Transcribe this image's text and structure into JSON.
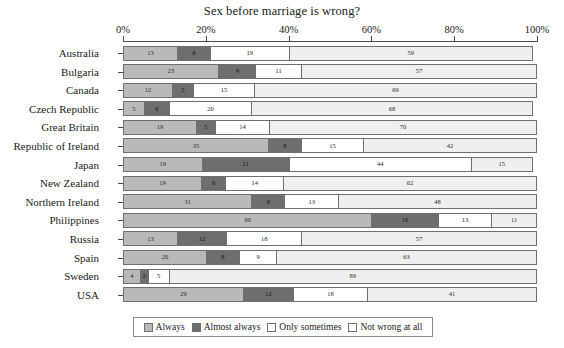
{
  "chart_data": {
    "type": "bar",
    "title": "Sex before marriage is wrong?",
    "xlabel": "",
    "ylabel": "",
    "xlim": [
      0,
      100
    ],
    "grid": false,
    "orientation": "horizontal",
    "stacked": true,
    "legend_position": "bottom",
    "tick_labels": [
      "0%",
      "20%",
      "40%",
      "60%",
      "80%",
      "100%"
    ],
    "tick_values": [
      0,
      20,
      40,
      60,
      80,
      100
    ],
    "categories": [
      "Australia",
      "Bulgaria",
      "Canada",
      "Czech Republic",
      "Great Britain",
      "Republic of Ireland",
      "Japan",
      "New Zealand",
      "Northern Ireland",
      "Philippines",
      "Russia",
      "Spain",
      "Sweden",
      "USA"
    ],
    "series": [
      {
        "name": "Always",
        "color": "#b9b9b9",
        "values": [
          13,
          23,
          12,
          5,
          19,
          35,
          19,
          19,
          31,
          60,
          13,
          20,
          4,
          29
        ]
      },
      {
        "name": "Almost always",
        "color": "#6e6e6e",
        "values": [
          8,
          9,
          5,
          6,
          5,
          8,
          21,
          6,
          8,
          16,
          12,
          8,
          2,
          12
        ]
      },
      {
        "name": "Only sometimes",
        "color": "#ffffff",
        "values": [
          19,
          11,
          15,
          20,
          14,
          15,
          44,
          14,
          13,
          13,
          18,
          9,
          5,
          18
        ]
      },
      {
        "name": "Not wrong at all",
        "color": "#efefef",
        "values": [
          59,
          57,
          69,
          68,
          70,
          42,
          15,
          62,
          48,
          11,
          57,
          63,
          89,
          41
        ]
      }
    ]
  },
  "legend": {
    "items": [
      {
        "label": "Always",
        "swatch": "always"
      },
      {
        "label": "Almost always",
        "swatch": "almost"
      },
      {
        "label": "Only sometimes",
        "swatch": "sometimes"
      },
      {
        "label": "Not wrong at all",
        "swatch": "notwrong"
      }
    ]
  }
}
